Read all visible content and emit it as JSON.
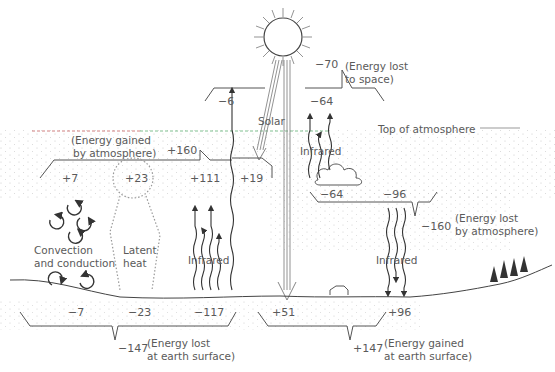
{
  "labels": {
    "top_of_atmosphere": "Top of atmosphere",
    "solar": "Solar",
    "infrared_upper": "Infrared",
    "infrared_left": "Infrared",
    "infrared_right": "Infrared",
    "convection": "Convection",
    "conduction": "and conduction",
    "latent": "Latent",
    "heat": "heat"
  },
  "space": {
    "reflected_solar": "−6",
    "infrared_to_space": "−64",
    "total": "−70",
    "caption_line1": "(Energy lost",
    "caption_line2": "to space)"
  },
  "atmosphere_gain": {
    "caption_line1": "(Energy gained",
    "caption_line2": "by atmosphere)",
    "total": "+160",
    "convection": "+7",
    "latent": "+23",
    "infrared": "+111",
    "solar": "+19"
  },
  "atmosphere_loss": {
    "to_space": "−64",
    "to_surface": "−96",
    "total": "−160",
    "caption_line1": "(Energy lost",
    "caption_line2": "by atmosphere)"
  },
  "surface_loss": {
    "convection": "−7",
    "latent": "−23",
    "infrared": "−117",
    "total": "−147",
    "caption_line1": "(Energy lost",
    "caption_line2": "at earth surface)"
  },
  "surface_gain": {
    "solar": "+51",
    "infrared": "+96",
    "total": "+147",
    "caption_line1": "(Energy gained",
    "caption_line2": "at earth surface)"
  },
  "colors": {
    "ink": "#333333",
    "text": "#5a5a5a",
    "stipple": "#b8b8b8",
    "toa_red": "#d08080",
    "toa_green": "#80c090"
  }
}
